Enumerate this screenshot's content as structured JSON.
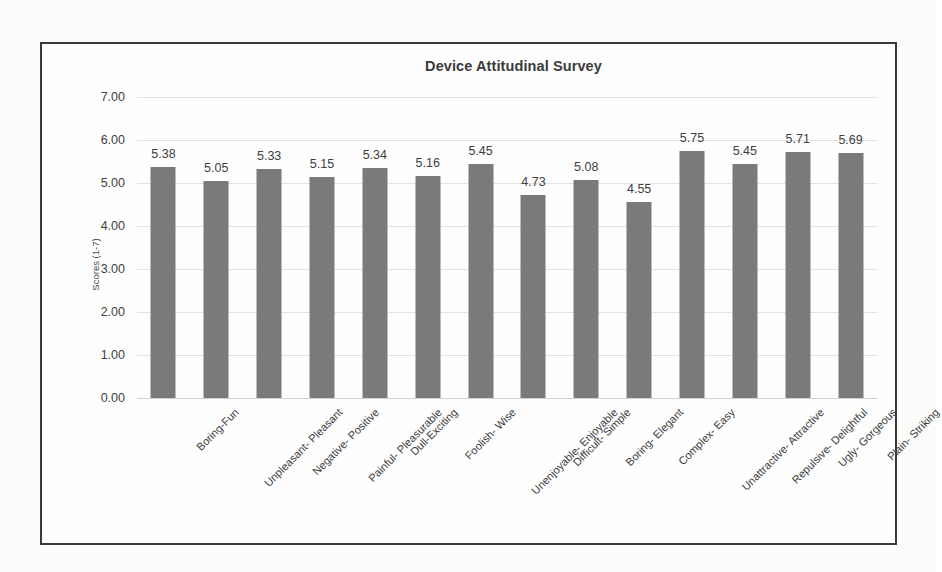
{
  "chart_data": {
    "type": "bar",
    "title": "Device Attitudinal Survey",
    "xlabel": "",
    "ylabel": "Scores (1-7)",
    "ylim": [
      0,
      7
    ],
    "ytick_labels": [
      "7.00",
      "6.00",
      "5.00",
      "4.00",
      "3.00",
      "2.00",
      "1.00",
      "0.00"
    ],
    "ytick_values": [
      7,
      6,
      5,
      4,
      3,
      2,
      1,
      0
    ],
    "grid": true,
    "legend": false,
    "bar_color": "#7a7a7a",
    "categories": [
      "Boring-Fun",
      "Unpleasant- Pleasant",
      "Negative- Positive",
      "Painful- Pleasurable",
      "Dull-Exciting",
      "Foolish- Wise",
      "Unenjoyable- Enjoyable",
      "Difficult- Simple",
      "Boring- Elegant",
      "Complex- Easy",
      "Unattractive- Attractive",
      "Repulsive- Delightful",
      "Ugly- Gorgeous",
      "Plain- Striking"
    ],
    "values": [
      5.38,
      5.05,
      5.33,
      5.15,
      5.34,
      5.16,
      5.45,
      4.73,
      5.08,
      4.55,
      5.75,
      5.45,
      5.71,
      5.69
    ],
    "value_labels": [
      "5.38",
      "5.05",
      "5.33",
      "5.15",
      "5.34",
      "5.16",
      "5.45",
      "4.73",
      "5.08",
      "4.55",
      "5.75",
      "5.45",
      "5.71",
      "5.69"
    ]
  }
}
